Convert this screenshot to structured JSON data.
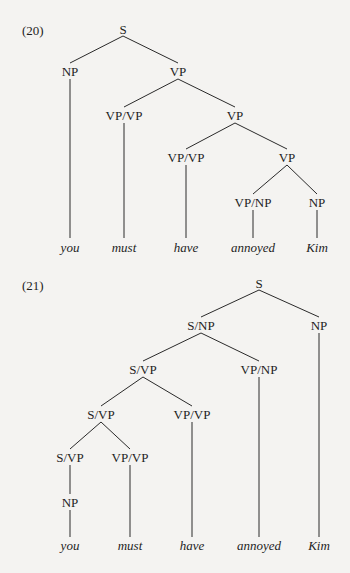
{
  "examples": [
    {
      "number": "(20)",
      "nodes": {
        "s": "S",
        "np": "NP",
        "vp1": "VP",
        "vpvp1": "VP/VP",
        "vp2": "VP",
        "vpvp2": "VP/VP",
        "vp3": "VP",
        "vpnp": "VP/NP",
        "np2": "NP"
      },
      "leaves": [
        "you",
        "must",
        "have",
        "annoyed",
        "Kim"
      ]
    },
    {
      "number": "(21)",
      "nodes": {
        "s": "S",
        "snp": "S/NP",
        "np": "NP",
        "svp1": "S/VP",
        "vpnp": "VP/NP",
        "svp2": "S/VP",
        "vpvp1": "VP/VP",
        "svp3": "S/VP",
        "vpvp2": "VP/VP",
        "np2": "NP"
      },
      "leaves": [
        "you",
        "must",
        "have",
        "annoyed",
        "Kim"
      ]
    }
  ],
  "colors": {
    "background": "#f4f3f1",
    "ink": "#1e1e1e"
  }
}
